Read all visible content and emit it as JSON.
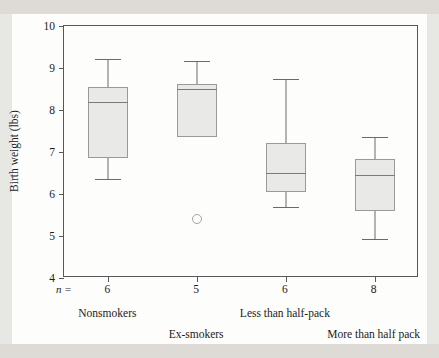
{
  "chart_data": {
    "type": "box",
    "title": "",
    "xlabel": "",
    "ylabel": "Birth weight (lbs)",
    "ylim": [
      4,
      10
    ],
    "ytick_labels": [
      "10",
      "9",
      "8",
      "7",
      "6",
      "5",
      "4"
    ],
    "ytick_values": [
      10,
      9,
      8,
      7,
      6,
      5,
      4
    ],
    "grid": false,
    "legend": "none",
    "n_prefix": "n =",
    "categories": [
      "Nonsmokers",
      "Ex-smokers",
      "Less than half-pack",
      "More than half pack"
    ],
    "n_values": [
      "6",
      "5",
      "6",
      "8"
    ],
    "boxes": [
      {
        "category": "Nonsmokers",
        "n": 6,
        "whisker_low": 6.36,
        "q1": 6.86,
        "median": 8.2,
        "q3": 8.55,
        "whisker_high": 9.22,
        "outliers": []
      },
      {
        "category": "Ex-smokers",
        "n": 5,
        "whisker_low": 7.36,
        "q1": 7.36,
        "median": 8.5,
        "q3": 8.62,
        "whisker_high": 9.17,
        "outliers": [
          5.4
        ]
      },
      {
        "category": "Less than half-pack",
        "n": 6,
        "whisker_low": 5.69,
        "q1": 6.05,
        "median": 6.5,
        "q3": 7.21,
        "whisker_high": 8.74,
        "outliers": []
      },
      {
        "category": "More than half pack",
        "n": 8,
        "whisker_low": 4.93,
        "q1": 5.6,
        "median": 6.45,
        "q3": 6.83,
        "whisker_high": 7.36,
        "outliers": []
      }
    ],
    "colors": {
      "box_fill": "#e9e9e7",
      "box_edge": "#9a9a98",
      "median": "#7b7b7b",
      "whisker": "#6a6a6c",
      "axis": "#58585a",
      "plot_background": "#fdfdfc",
      "page_background": "#e7e7e4"
    }
  }
}
